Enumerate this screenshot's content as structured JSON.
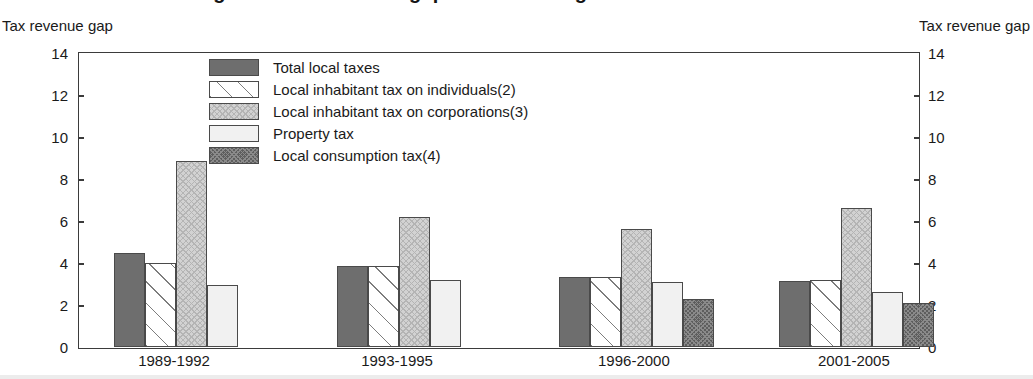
{
  "title": "Figure 5. Tax revenue gap across local governments",
  "axis_caption_left": "Tax revenue gap",
  "axis_caption_right": "Tax revenue gap",
  "legend": {
    "items": [
      {
        "label": "Total local taxes",
        "pattern": "solid-dark-gray"
      },
      {
        "label": "Local inhabitant tax on individuals(2)",
        "pattern": "white-diagonal-lines"
      },
      {
        "label": "Local inhabitant tax on corporations(3)",
        "pattern": "light-gray-crosshatch"
      },
      {
        "label": "Property tax",
        "pattern": "near-white-solid"
      },
      {
        "label": "Local consumption tax(4)",
        "pattern": "dark-gray-checker"
      }
    ]
  },
  "chart_data": {
    "type": "bar",
    "title": "Figure 5. Tax revenue gap across local governments",
    "xlabel": "",
    "ylabel": "Tax revenue gap",
    "ylim": [
      0,
      14
    ],
    "yticks": [
      0,
      2,
      4,
      6,
      8,
      10,
      12,
      14
    ],
    "ytick_labels": [
      "0",
      "2",
      "4",
      "6",
      "8",
      "10",
      "12",
      "14"
    ],
    "grid": false,
    "legend_position": "upper-left-inside",
    "categories": [
      "1989-1992",
      "1993-1995",
      "1996-2000",
      "2001-2005"
    ],
    "series": [
      {
        "name": "Total local taxes",
        "values": [
          4.5,
          3.85,
          3.35,
          3.15
        ]
      },
      {
        "name": "Local inhabitant tax on individuals(2)",
        "values": [
          4.0,
          3.85,
          3.35,
          3.2
        ]
      },
      {
        "name": "Local inhabitant tax on corporations(3)",
        "values": [
          8.85,
          6.2,
          5.6,
          6.6
        ]
      },
      {
        "name": "Property tax",
        "values": [
          2.95,
          3.2,
          3.1,
          2.6
        ]
      },
      {
        "name": "Local consumption tax(4)",
        "values": [
          null,
          null,
          2.3,
          2.1
        ]
      }
    ]
  }
}
